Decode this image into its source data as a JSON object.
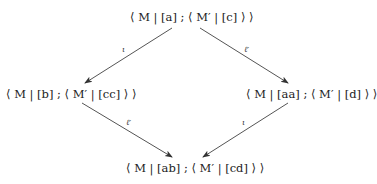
{
  "diagram": {
    "type": "commutative-diamond",
    "nodes": {
      "top": {
        "text": "⟨ M | [a] ; ⟨ M′ | [c] ⟩ ⟩"
      },
      "left": {
        "text": "⟨ M | [b] ; ⟨ M′ | [cc] ⟩ ⟩"
      },
      "right": {
        "text": "⟨ M | [aa] ; ⟨ M′ | [d] ⟩ ⟩"
      },
      "bottom": {
        "text": "⟨ M | [ab] ; ⟨ M′ | [cd] ⟩ ⟩"
      }
    },
    "edges": [
      {
        "from": "top",
        "to": "left",
        "label": "ι"
      },
      {
        "from": "top",
        "to": "right",
        "label": "ℓ′"
      },
      {
        "from": "left",
        "to": "bottom",
        "label": "ℓ′"
      },
      {
        "from": "right",
        "to": "bottom",
        "label": "ι"
      }
    ],
    "colors": {
      "arrow": "#444444",
      "text": "#222222"
    }
  }
}
